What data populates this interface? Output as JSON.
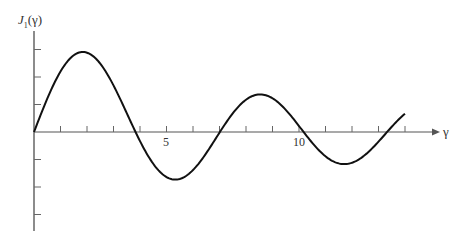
{
  "chart_data": {
    "type": "line",
    "title": "",
    "xlabel": "γ",
    "ylabel": "J₁(γ)",
    "x_tick_labels": [
      {
        "value": 5,
        "label": "5"
      },
      {
        "value": 10,
        "label": "10"
      }
    ],
    "x_ticks": [
      1,
      2,
      3,
      4,
      5,
      6,
      7,
      8,
      9,
      10,
      11,
      12,
      13,
      14
    ],
    "y_ticks": [
      -0.6,
      -0.4,
      -0.2,
      0.2,
      0.4,
      0.6
    ],
    "xlim": [
      0,
      14
    ],
    "ylim": [
      -0.6,
      0.65
    ],
    "grid": false,
    "series": [
      {
        "name": "J1(γ)",
        "x": [
          0,
          0.5,
          1,
          1.5,
          1.84,
          2.5,
          3,
          3.83,
          4.5,
          5,
          5.33,
          6,
          7,
          7.02,
          7.5,
          8,
          8.54,
          9,
          10,
          10.17,
          11,
          11.71,
          12,
          13,
          13.32,
          14
        ],
        "values": [
          0,
          0.242,
          0.44,
          0.558,
          0.582,
          0.497,
          0.339,
          0,
          -0.231,
          -0.328,
          -0.346,
          -0.277,
          -0.005,
          0,
          0.135,
          0.235,
          0.273,
          0.245,
          0.043,
          0,
          -0.177,
          -0.223,
          -0.223,
          -0.07,
          0,
          0.133
        ]
      }
    ]
  },
  "labels": {
    "ylabel": "J",
    "ylabel_sub": "1",
    "ylabel_arg": "(γ)",
    "xlabel": "γ",
    "tick5": "5",
    "tick10": "10"
  }
}
